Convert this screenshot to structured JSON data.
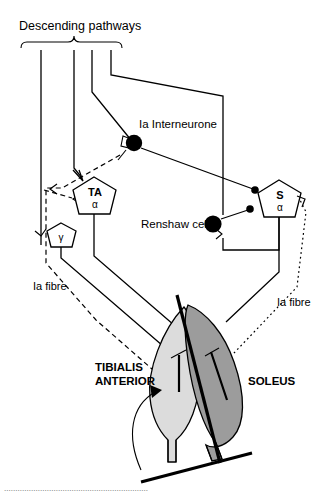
{
  "figure": {
    "background_color": "#ffffff",
    "line_color": "#000000"
  },
  "labels": {
    "descending_pathways": "Descending pathways",
    "ia_interneurone": "Ia Interneurone",
    "renshaw_cell": "Renshaw cell",
    "ia_fibre_left": "Ia fibre",
    "ia_fibre_right": "Ia fibre",
    "tibialis_anterior_line1": "TIBIALIS",
    "tibialis_anterior_line2": "ANTERIOR",
    "soleus": "SOLEUS"
  },
  "neurons": [
    {
      "id": "ta-alpha",
      "name": "TA",
      "greek": "α",
      "shape": "pentagon",
      "fill": "#ffffff",
      "description": "tibialis anterior alpha motoneurone"
    },
    {
      "id": "gamma",
      "name": "",
      "greek": "γ",
      "shape": "pentagon",
      "fill": "#ffffff",
      "description": "gamma motoneurone"
    },
    {
      "id": "s-alpha",
      "name": "S",
      "greek": "α",
      "shape": "pentagon",
      "fill": "#ffffff",
      "description": "soleus alpha motoneurone"
    },
    {
      "id": "ia-interneurone",
      "name": "Ia Interneurone",
      "greek": "",
      "shape": "filled-circle",
      "fill": "#000000",
      "description": "Ia inhibitory interneurone"
    },
    {
      "id": "renshaw-cell",
      "name": "Renshaw cell",
      "greek": "",
      "shape": "filled-circle",
      "fill": "#000000",
      "description": "Renshaw inhibitory interneurone"
    }
  ],
  "muscles": [
    {
      "id": "tibialis-anterior",
      "label": "TIBIALIS ANTERIOR",
      "fill": "#dcdcdc",
      "stroke": "#000000"
    },
    {
      "id": "soleus",
      "label": "SOLEUS",
      "fill": "#9c9c9c",
      "stroke": "#000000"
    }
  ],
  "pathways": [
    {
      "id": "descending-1",
      "style": "solid",
      "label": "Descending pathways"
    },
    {
      "id": "descending-2",
      "style": "solid",
      "label": "Descending pathways"
    },
    {
      "id": "descending-3",
      "style": "solid",
      "label": "Descending pathways"
    },
    {
      "id": "descending-4",
      "style": "solid",
      "label": "Descending pathways"
    },
    {
      "id": "ia-fibre-ta",
      "style": "dashed",
      "label": "Ia fibre"
    },
    {
      "id": "ia-fibre-soleus",
      "style": "dotted",
      "label": "Ia fibre"
    },
    {
      "id": "motor-axon-ta",
      "style": "solid",
      "label": ""
    },
    {
      "id": "motor-axon-soleus",
      "style": "solid",
      "label": ""
    },
    {
      "id": "renshaw-recurrent",
      "style": "solid",
      "label": ""
    }
  ],
  "caption": {
    "text": "partly cut-off caption line at bottom of figure"
  }
}
